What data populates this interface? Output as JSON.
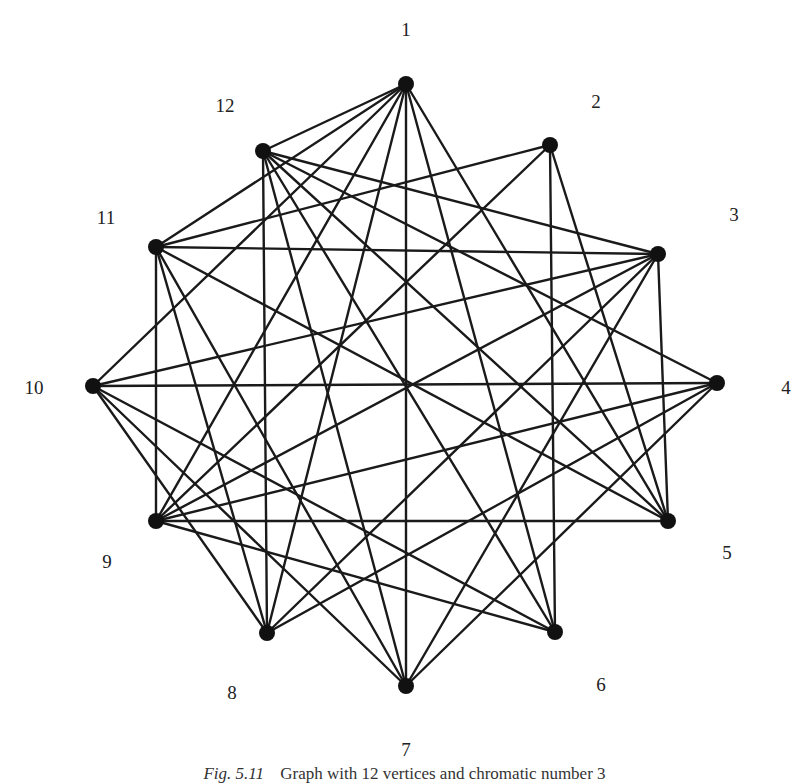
{
  "figure": {
    "caption_number": "Fig. 5.11",
    "caption_text": "Graph with 12 vertices and chromatic number 3",
    "colors": {
      "edge": "#1a1a1a",
      "vertex": "#111111",
      "label": "#222222",
      "background": "#ffffff"
    },
    "vertex_radius": 8
  },
  "vertices": [
    {
      "id": "1",
      "x": 406,
      "y": 84,
      "label": "1",
      "lx": 406,
      "ly": 32
    },
    {
      "id": "2",
      "x": 550,
      "y": 145,
      "label": "2",
      "lx": 596,
      "ly": 104
    },
    {
      "id": "3",
      "x": 658,
      "y": 254,
      "label": "3",
      "lx": 734,
      "ly": 217
    },
    {
      "id": "4",
      "x": 717,
      "y": 383,
      "label": "4",
      "lx": 786,
      "ly": 390
    },
    {
      "id": "5",
      "x": 668,
      "y": 521,
      "label": "5",
      "lx": 727,
      "ly": 555
    },
    {
      "id": "6",
      "x": 555,
      "y": 632,
      "label": "6",
      "lx": 601,
      "ly": 687
    },
    {
      "id": "7",
      "x": 406,
      "y": 686,
      "label": "7",
      "lx": 406,
      "ly": 752
    },
    {
      "id": "8",
      "x": 267,
      "y": 633,
      "label": "8",
      "lx": 232,
      "ly": 695
    },
    {
      "id": "9",
      "x": 156,
      "y": 521,
      "label": "9",
      "lx": 107,
      "ly": 564
    },
    {
      "id": "10",
      "x": 93,
      "y": 386,
      "label": "10",
      "lx": 34,
      "ly": 390
    },
    {
      "id": "11",
      "x": 156,
      "y": 247,
      "label": "11",
      "lx": 106,
      "ly": 220
    },
    {
      "id": "12",
      "x": 263,
      "y": 151,
      "label": "12",
      "lx": 225,
      "ly": 108
    }
  ],
  "edges": [
    [
      "1",
      "12"
    ],
    [
      "1",
      "11"
    ],
    [
      "1",
      "10"
    ],
    [
      "1",
      "9"
    ],
    [
      "1",
      "8"
    ],
    [
      "1",
      "7"
    ],
    [
      "1",
      "6"
    ],
    [
      "1",
      "5"
    ],
    [
      "2",
      "11"
    ],
    [
      "2",
      "9"
    ],
    [
      "2",
      "6"
    ],
    [
      "2",
      "5"
    ],
    [
      "3",
      "12"
    ],
    [
      "3",
      "11"
    ],
    [
      "3",
      "10"
    ],
    [
      "3",
      "9"
    ],
    [
      "3",
      "8"
    ],
    [
      "3",
      "7"
    ],
    [
      "3",
      "5"
    ],
    [
      "4",
      "12"
    ],
    [
      "4",
      "10"
    ],
    [
      "4",
      "9"
    ],
    [
      "4",
      "8"
    ],
    [
      "4",
      "7"
    ],
    [
      "5",
      "12"
    ],
    [
      "5",
      "11"
    ],
    [
      "5",
      "9"
    ],
    [
      "6",
      "12"
    ],
    [
      "6",
      "10"
    ],
    [
      "6",
      "9"
    ],
    [
      "7",
      "12"
    ],
    [
      "7",
      "11"
    ],
    [
      "7",
      "10"
    ],
    [
      "8",
      "12"
    ],
    [
      "8",
      "11"
    ],
    [
      "8",
      "10"
    ],
    [
      "9",
      "11"
    ]
  ]
}
